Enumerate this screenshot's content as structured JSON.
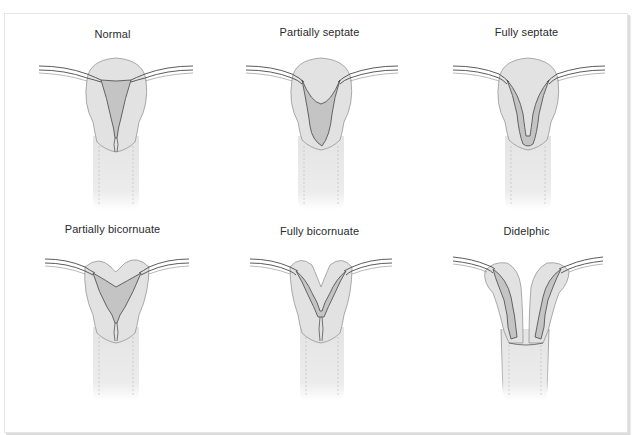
{
  "figure": {
    "colors": {
      "uterus_fill": "#e2e2e2",
      "cavity_fill": "#bfbfbf",
      "outline": "#555555",
      "tube": "#4a4a4a",
      "vagina_fill": "#eaeaea",
      "frame_border": "#e0e0e0"
    },
    "panels": [
      {
        "id": "normal",
        "label": "Normal"
      },
      {
        "id": "partially-septate",
        "label": "Partially septate"
      },
      {
        "id": "fully-septate",
        "label": "Fully septate"
      },
      {
        "id": "partially-bicornuate",
        "label": "Partially bicornuate"
      },
      {
        "id": "fully-bicornuate",
        "label": "Fully bicornuate"
      },
      {
        "id": "didelphic",
        "label": "Didelphic"
      }
    ]
  }
}
